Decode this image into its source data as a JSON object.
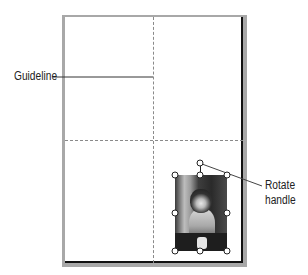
{
  "callouts": {
    "guideline": "Guideline",
    "rotate_handle_line1": "Rotate",
    "rotate_handle_line2": "handle"
  },
  "page": {
    "guides": [
      "vertical-guide",
      "horizontal-guide"
    ],
    "image": {
      "subject": "cat photo",
      "selected": true,
      "handles": [
        "top-left",
        "top-center",
        "top-right",
        "middle-left",
        "middle-right",
        "bottom-left",
        "bottom-center",
        "bottom-right",
        "rotate"
      ]
    }
  }
}
